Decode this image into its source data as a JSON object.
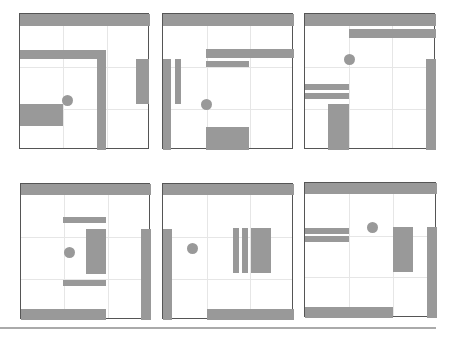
{
  "colors": {
    "fill": "#999999",
    "border": "#555555",
    "grid": "#e6e6e6"
  },
  "panels": [
    {
      "x": 19,
      "y": 13,
      "w": 130,
      "h": 136,
      "rects": [
        [
          0,
          0,
          130,
          12
        ],
        [
          0,
          36,
          86,
          9
        ],
        [
          77,
          36,
          9,
          100
        ],
        [
          116,
          45,
          13,
          45
        ],
        [
          0,
          90,
          43,
          22
        ]
      ],
      "dot": [
        47,
        86
      ]
    },
    {
      "x": 162,
      "y": 13,
      "w": 131,
      "h": 136,
      "rects": [
        [
          0,
          0,
          131,
          12
        ],
        [
          43,
          35,
          88,
          9
        ],
        [
          43,
          47,
          43,
          6
        ],
        [
          0,
          45,
          8,
          91
        ],
        [
          12,
          45,
          6,
          45
        ],
        [
          43,
          113,
          43,
          23
        ]
      ],
      "dot": [
        43,
        90
      ]
    },
    {
      "x": 304,
      "y": 13,
      "w": 131,
      "h": 136,
      "rects": [
        [
          0,
          0,
          131,
          12
        ],
        [
          44,
          15,
          87,
          9
        ],
        [
          121,
          45,
          10,
          91
        ],
        [
          0,
          70,
          44,
          6
        ],
        [
          0,
          79,
          44,
          6
        ],
        [
          23,
          90,
          21,
          46
        ]
      ],
      "dot": [
        44,
        45
      ]
    },
    {
      "x": 20,
      "y": 183,
      "w": 130,
      "h": 136,
      "rects": [
        [
          0,
          0,
          130,
          11
        ],
        [
          42,
          33,
          43,
          6
        ],
        [
          65,
          45,
          20,
          45
        ],
        [
          42,
          96,
          43,
          6
        ],
        [
          120,
          45,
          10,
          91
        ],
        [
          0,
          125,
          85,
          11
        ]
      ],
      "dot": [
        48,
        68
      ]
    },
    {
      "x": 162,
      "y": 183,
      "w": 131,
      "h": 136,
      "rects": [
        [
          0,
          0,
          131,
          11
        ],
        [
          0,
          45,
          9,
          91
        ],
        [
          70,
          44,
          6,
          45
        ],
        [
          79,
          44,
          6,
          45
        ],
        [
          88,
          44,
          20,
          45
        ],
        [
          44,
          125,
          87,
          11
        ]
      ],
      "dot": [
        29,
        64
      ]
    },
    {
      "x": 304,
      "y": 182,
      "w": 132,
      "h": 135,
      "rects": [
        [
          0,
          0,
          132,
          11
        ],
        [
          0,
          45,
          44,
          6
        ],
        [
          0,
          53,
          44,
          6
        ],
        [
          88,
          44,
          20,
          45
        ],
        [
          122,
          44,
          10,
          91
        ],
        [
          0,
          124,
          88,
          11
        ]
      ],
      "dot": [
        67,
        44
      ]
    }
  ]
}
